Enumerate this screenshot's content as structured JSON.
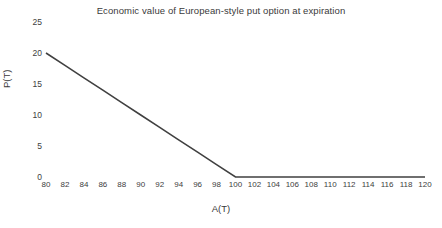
{
  "chart_data": {
    "type": "line",
    "title": "Economic value of European-style put option at expiration",
    "xlabel": "A(T)",
    "ylabel": "P(T)",
    "xlim": [
      80,
      120
    ],
    "ylim": [
      0,
      25
    ],
    "grid": false,
    "legend": null,
    "line_color": "#404040",
    "xticks": [
      80,
      82,
      84,
      86,
      88,
      90,
      92,
      94,
      96,
      98,
      100,
      102,
      104,
      106,
      108,
      110,
      112,
      114,
      116,
      118,
      120
    ],
    "yticks": [
      0,
      5,
      10,
      15,
      20,
      25
    ],
    "series": [
      {
        "name": "P(T)",
        "x": [
          80,
          82,
          84,
          86,
          88,
          90,
          92,
          94,
          96,
          98,
          100,
          102,
          104,
          106,
          108,
          110,
          112,
          114,
          116,
          118,
          120
        ],
        "values": [
          20,
          18,
          16,
          14,
          12,
          10,
          8,
          6,
          4,
          2,
          0,
          0,
          0,
          0,
          0,
          0,
          0,
          0,
          0,
          0,
          0
        ]
      }
    ]
  }
}
